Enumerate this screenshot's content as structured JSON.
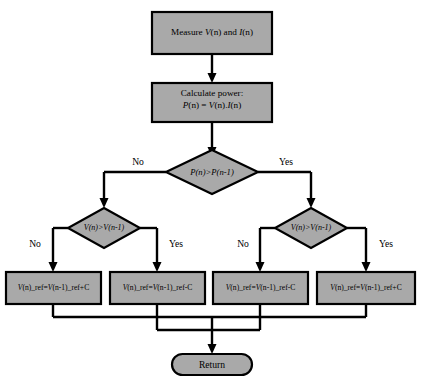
{
  "diagram": {
    "background_color": "#ffffff",
    "shape_fill_color": "#a9a9a9",
    "shape_border_color": "#000000",
    "connector_color": "#000000"
  },
  "nodes": {
    "measure": {
      "type": "process",
      "line1_prefix": "Measure ",
      "line1_var1": "V",
      "line1_arg1": "(n)",
      "line1_mid": " and ",
      "line1_var2": "I",
      "line1_arg2": "(n)",
      "plain": "Measure V(n) and I(n)"
    },
    "calculate": {
      "type": "process",
      "line1": "Calculate power:",
      "line2_plain": "P(n) = V(n).I(n)",
      "line2_p": "P",
      "line2_pn": "(n)",
      "line2_eq": " = ",
      "line2_v": "V",
      "line2_vn": "(n).",
      "line2_i": "I",
      "line2_in": "(n)"
    },
    "decision_power": {
      "type": "decision",
      "condition": "P(n)>P(n-1)",
      "label_left": "No",
      "label_right": "Yes"
    },
    "decision_voltage_left": {
      "type": "decision",
      "condition": "V(n)>V(n-1)",
      "label_left": "No",
      "label_right": "Yes"
    },
    "decision_voltage_right": {
      "type": "decision",
      "condition": "V(n)>V(n-1)",
      "label_left": "No",
      "label_right": "Yes"
    },
    "result_1": {
      "type": "process",
      "text": "V(n)_ref=V(n-1)_ref+C",
      "lhs_var": "V",
      "lhs_rest": "(n)_ref=",
      "rhs_var": "V",
      "rhs_rest": "(n-1)_ref+C"
    },
    "result_2": {
      "type": "process",
      "text": "V(n)_ref=V(n-1)_ref-C",
      "lhs_var": "V",
      "lhs_rest": "(n)_ref=",
      "rhs_var": "V",
      "rhs_rest": "(n-1)_ref-C"
    },
    "result_3": {
      "type": "process",
      "text": "V(n)_ref=V(n-1)_ref-C",
      "lhs_var": "V",
      "lhs_rest": "(n)_ref=",
      "rhs_var": "V",
      "rhs_rest": "(n-1)_ref-C"
    },
    "result_4": {
      "type": "process",
      "text": "V(n)_ref=V(n-1)_ref+C",
      "lhs_var": "V",
      "lhs_rest": "(n)_ref=",
      "rhs_var": "V",
      "rhs_rest": "(n-1)_ref+C"
    },
    "return_node": {
      "type": "terminator",
      "label": "Return"
    }
  }
}
